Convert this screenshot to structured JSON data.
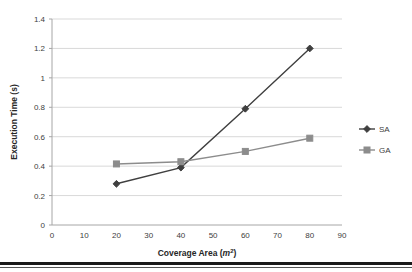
{
  "chart_data": {
    "type": "line",
    "title": "",
    "xlabel": "Coverage Area (m2)",
    "xlabel_main": "Coverage Area (",
    "xlabel_var": "m",
    "xlabel_sup": "2",
    "xlabel_close": ")",
    "ylabel": "Execution Time (s)",
    "x": [
      20,
      40,
      60,
      80
    ],
    "xlim": [
      0,
      90
    ],
    "ylim": [
      0,
      1.4
    ],
    "xticks": [
      "0",
      "10",
      "20",
      "30",
      "40",
      "50",
      "60",
      "70",
      "80",
      "90"
    ],
    "xtick_values": [
      0,
      10,
      20,
      30,
      40,
      50,
      60,
      70,
      80,
      90
    ],
    "yticks": [
      "0",
      "0.2",
      "0.4",
      "0.6",
      "0.8",
      "1",
      "1.2",
      "1.4"
    ],
    "ytick_values": [
      0,
      0.2,
      0.4,
      0.6,
      0.8,
      1,
      1.2,
      1.4
    ],
    "grid": true,
    "legend_position": "right",
    "series": [
      {
        "name": "SA",
        "marker": "diamond",
        "color": "#3f3f3f",
        "values": [
          0.28,
          0.39,
          0.79,
          1.2
        ]
      },
      {
        "name": "GA",
        "marker": "square",
        "color": "#8c8c8c",
        "values": [
          0.415,
          0.43,
          0.5,
          0.59
        ]
      }
    ]
  },
  "legend": {
    "entries": [
      {
        "label": "SA"
      },
      {
        "label": "GA"
      }
    ]
  },
  "colors": {
    "series_sa": "#3f3f3f",
    "series_ga": "#8c8c8c",
    "grid": "#d9d9d9",
    "axis": "#a6a6a6",
    "text": "#404040",
    "footer": "#1a1a1a"
  }
}
